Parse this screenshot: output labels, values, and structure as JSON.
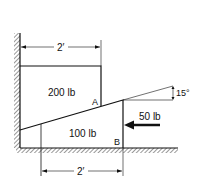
{
  "diagram": {
    "type": "statics-wedge-problem",
    "upper_block": {
      "label": "200 lb",
      "point": "A"
    },
    "wedge": {
      "label": "100 lb",
      "point": "B"
    },
    "force": {
      "label": "50 lb",
      "direction": "left"
    },
    "angle": {
      "label": "15°"
    },
    "dimensions": {
      "top": "2′",
      "bottom": "2′"
    }
  }
}
